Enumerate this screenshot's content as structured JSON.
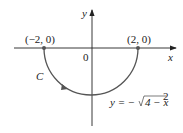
{
  "diagram": {
    "axes": {
      "x_label": "x",
      "y_label": "y",
      "origin_label": "0"
    },
    "points": [
      {
        "label": "(−2, 0)"
      },
      {
        "label": "(2, 0)"
      }
    ],
    "curve": {
      "name": "C",
      "equation_lhs": "y = −",
      "equation_radical": "4 − x",
      "equation_exp": "2",
      "orientation": "counterclockwise from (−2,0) to (2,0) through lower half"
    },
    "colors": {
      "axis": "#222222",
      "curve": "#555555"
    }
  }
}
